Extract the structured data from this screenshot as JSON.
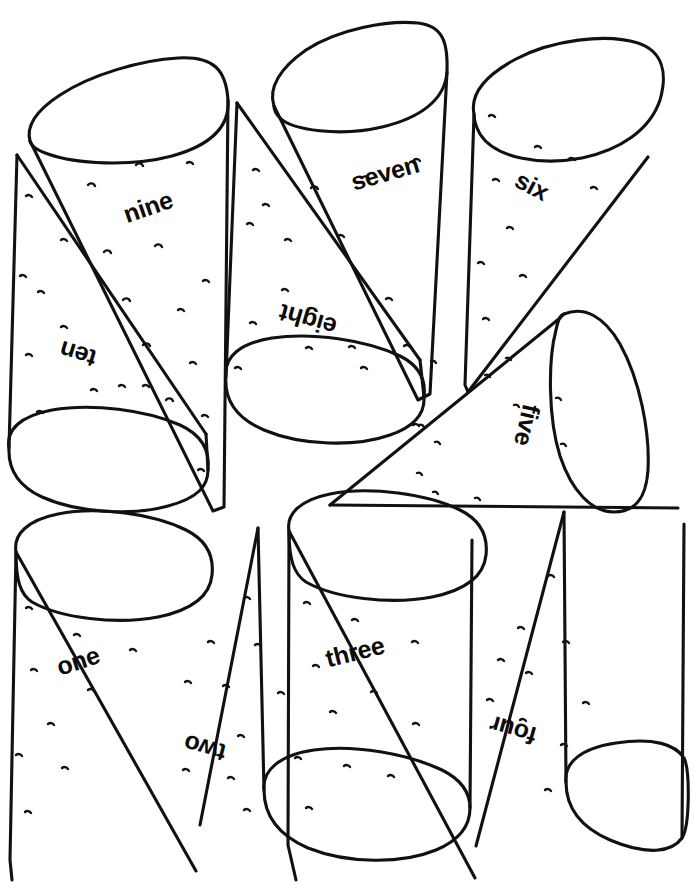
{
  "page": {
    "kind": "coloring-page",
    "background_color": "#ffffff",
    "ink_color": "#111111",
    "width": 695,
    "height": 893
  },
  "cones": [
    {
      "id": "cone-one",
      "label": "one",
      "number": 1,
      "label_x": 78,
      "label_y": 661,
      "label_rotation": -18,
      "orientation": "tip-down",
      "opening": "top-left",
      "group": "bottom-left-pair"
    },
    {
      "id": "cone-two",
      "label": "two",
      "number": 2,
      "label_x": 205,
      "label_y": 748,
      "label_rotation": 195,
      "orientation": "tip-up",
      "opening": "bottom",
      "group": "bottom-left-pair"
    },
    {
      "id": "cone-three",
      "label": "three",
      "number": 3,
      "label_x": 355,
      "label_y": 652,
      "label_rotation": -14,
      "orientation": "tip-down",
      "opening": "top-left",
      "group": "bottom-right-pair"
    },
    {
      "id": "cone-four",
      "label": "four",
      "number": 4,
      "label_x": 513,
      "label_y": 730,
      "label_rotation": 196,
      "orientation": "tip-up",
      "opening": "bottom",
      "group": "bottom-right-pair"
    },
    {
      "id": "cone-five",
      "label": "five",
      "number": 5,
      "label_x": 527,
      "label_y": 425,
      "label_rotation": 103,
      "orientation": "tip-left",
      "opening": "right",
      "group": "middle-right-single"
    },
    {
      "id": "cone-six",
      "label": "six",
      "number": 6,
      "label_x": 532,
      "label_y": 186,
      "label_rotation": 28,
      "orientation": "tip-down-left",
      "opening": "top-right",
      "group": "top-right-single"
    },
    {
      "id": "cone-seven",
      "label": "seven",
      "number": 7,
      "label_x": 385,
      "label_y": 173,
      "label_rotation": -16,
      "orientation": "tip-down",
      "opening": "top",
      "group": "top-middle-pair"
    },
    {
      "id": "cone-eight",
      "label": "eight",
      "number": 8,
      "label_x": 308,
      "label_y": 320,
      "label_rotation": 196,
      "orientation": "tip-up",
      "opening": "bottom",
      "group": "top-middle-pair"
    },
    {
      "id": "cone-nine",
      "label": "nine",
      "number": 9,
      "label_x": 148,
      "label_y": 207,
      "label_rotation": -19,
      "orientation": "tip-down",
      "opening": "top",
      "group": "top-left-pair"
    },
    {
      "id": "cone-ten",
      "label": "ten",
      "number": 10,
      "label_x": 78,
      "label_y": 354,
      "label_rotation": 197,
      "orientation": "tip-up",
      "opening": "bottom",
      "group": "top-left-pair"
    }
  ]
}
